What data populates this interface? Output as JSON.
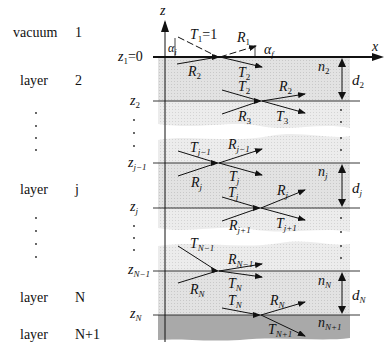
{
  "axes": {
    "z_label": "z",
    "x_label": "x"
  },
  "left_column": [
    {
      "name": "vacuum",
      "index": "1"
    },
    {
      "name": "layer",
      "index": "2"
    },
    {
      "name": "layer",
      "index": "j"
    },
    {
      "name": "layer",
      "index": "N"
    },
    {
      "name": "layer",
      "index": "N+1"
    }
  ],
  "interfaces": [
    {
      "label": "z",
      "sub": "1",
      "suffix": "=0"
    },
    {
      "label": "z",
      "sub": "2",
      "suffix": ""
    },
    {
      "label": "z",
      "sub": "j−1",
      "suffix": ""
    },
    {
      "label": "z",
      "sub": "j",
      "suffix": ""
    },
    {
      "label": "z",
      "sub": "N−1",
      "suffix": ""
    },
    {
      "label": "z",
      "sub": "N",
      "suffix": ""
    }
  ],
  "waves": {
    "top": {
      "incident": {
        "main": "T",
        "sub": "1",
        "suffix": "=1"
      },
      "reflected_out": {
        "main": "R",
        "sub": "1"
      },
      "up_in": {
        "main": "R",
        "sub": "2"
      },
      "trans": {
        "main": "T",
        "sub": "2"
      },
      "angle_in": {
        "main": "α",
        "sub": "i"
      },
      "angle_out": {
        "main": "α",
        "sub": "f"
      }
    },
    "z2": {
      "in": {
        "main": "T",
        "sub": "2"
      },
      "out_r": {
        "main": "R",
        "sub": "2"
      },
      "up_in": {
        "main": "R",
        "sub": "3"
      },
      "trans": {
        "main": "T",
        "sub": "3"
      }
    },
    "zj1": {
      "in": {
        "main": "T",
        "sub": "j−1"
      },
      "out_r": {
        "main": "R",
        "sub": "j−1"
      },
      "up_in": {
        "main": "R",
        "sub": "j"
      },
      "trans": {
        "main": "T",
        "sub": "j"
      }
    },
    "zj": {
      "in": {
        "main": "T",
        "sub": "j"
      },
      "out_r": {
        "main": "R",
        "sub": "j"
      },
      "up_in": {
        "main": "R",
        "sub": "j+1"
      },
      "trans": {
        "main": "T",
        "sub": "j+1"
      }
    },
    "zN1": {
      "in": {
        "main": "T",
        "sub": "N−1"
      },
      "out_r": {
        "main": "R",
        "sub": "N−1"
      },
      "up_in": {
        "main": "R",
        "sub": "N"
      },
      "trans": {
        "main": "T",
        "sub": "N"
      }
    },
    "zN": {
      "in": {
        "main": "T",
        "sub": "N"
      },
      "out_r": {
        "main": "R",
        "sub": "N"
      },
      "trans": {
        "main": "T",
        "sub": "N+1"
      }
    }
  },
  "layers": [
    {
      "n_main": "n",
      "n_sub": "2",
      "d_main": "d",
      "d_sub": "2"
    },
    {
      "n_main": "n",
      "n_sub": "j",
      "d_main": "d",
      "d_sub": "j"
    },
    {
      "n_main": "n",
      "n_sub": "N",
      "d_main": "d",
      "d_sub": "N"
    },
    {
      "n_main": "n",
      "n_sub": "N+1"
    }
  ],
  "colors": {
    "layer_fill": "#d9d9d9",
    "substrate_fill": "#a8a8a8",
    "line": "#111111"
  }
}
